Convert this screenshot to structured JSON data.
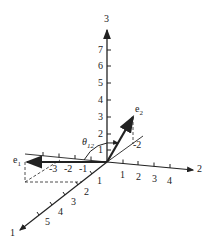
{
  "diagram": {
    "axes": {
      "axis1": {
        "label": "1",
        "ticks": [
          "1",
          "2",
          "3",
          "4",
          "5"
        ]
      },
      "axis2": {
        "label": "2",
        "ticks": [
          "1",
          "2",
          "3",
          "4"
        ]
      },
      "axis3": {
        "label": "3",
        "ticks": [
          "1",
          "2",
          "3",
          "4",
          "5",
          "6",
          "7"
        ]
      },
      "negative_axis2_ticks": [
        "-3",
        "-2",
        "-1"
      ],
      "negative_axis1_tick": "-2"
    },
    "vectors": {
      "e1": {
        "label": "e",
        "sub": "1"
      },
      "e2": {
        "label": "e",
        "sub": "2"
      }
    },
    "angle": {
      "symbol": "θ",
      "sub": "12"
    },
    "colors": {
      "ink": "#222222",
      "background": "#ffffff"
    }
  }
}
